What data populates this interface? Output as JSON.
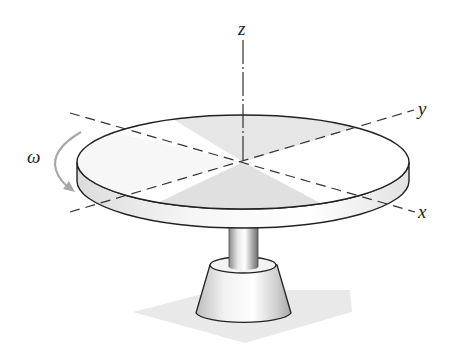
{
  "figure": {
    "axes": {
      "z_label": "z",
      "y_label": "y",
      "x_label": "x"
    },
    "rotation": {
      "label": "ω",
      "direction": "counterclockwise about z (arrow pointing down on left side)"
    },
    "colors": {
      "outline": "#222222",
      "shade_light": "#f4f4f4",
      "shade_mid": "#d9d9d9",
      "shadow": "#e6e6e6",
      "arrow": "#a8a8a8"
    }
  }
}
